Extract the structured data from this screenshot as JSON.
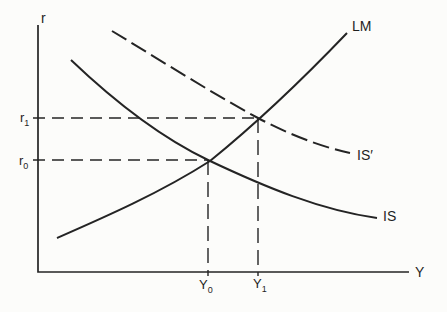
{
  "figure": {
    "bg_color": "#fcfcfa",
    "ink_color": "#242424",
    "width": 447,
    "height": 312,
    "axes": {
      "y_axis_label": "r",
      "x_axis_label": "Y",
      "origin_x": 38,
      "origin_y": 272,
      "y_top": 25,
      "x_right": 409,
      "y_label_x": 41,
      "y_label_y": 23,
      "x_label_x": 415,
      "x_label_y": 277,
      "stroke_width": 1.7
    },
    "curves": [
      {
        "id": "lm",
        "label": "LM",
        "dashed": false,
        "path": "M57,238 C105,217 160,193 210,161 C252,127 303,79 347,33",
        "label_x": 352,
        "label_y": 31,
        "stroke_width": 2
      },
      {
        "id": "is",
        "label": "IS",
        "dashed": false,
        "path": "M71,60 C115,102 160,137 208,160 C265,187 320,210 377,218",
        "label_x": 383,
        "label_y": 221,
        "stroke_width": 2
      },
      {
        "id": "is-prime",
        "label": "IS′",
        "dashed": true,
        "dash_pattern": "17 6",
        "path": "M112,31 C160,60 210,92 258,118 C290,135 322,147 350,153",
        "label_x": 357,
        "label_y": 160,
        "stroke_width": 2
      }
    ],
    "guides": [
      {
        "id": "r1-guide",
        "x1": 33,
        "y1": 118,
        "x2": 258,
        "y2": 118,
        "dash": "12 7",
        "stroke_width": 1.4
      },
      {
        "id": "r0-guide",
        "x1": 33,
        "y1": 160,
        "x2": 208,
        "y2": 160,
        "dash": "12 7",
        "stroke_width": 1.4
      },
      {
        "id": "y0-guide",
        "x1": 208,
        "y1": 160,
        "x2": 208,
        "y2": 276,
        "dash": "15 7",
        "stroke_width": 1.4
      },
      {
        "id": "y1-guide",
        "x1": 258,
        "y1": 118,
        "x2": 258,
        "y2": 276,
        "dash": "15 7",
        "stroke_width": 1.4
      }
    ],
    "point_labels": [
      {
        "id": "r1",
        "base": "r",
        "sub": "1",
        "x": 20,
        "y": 122
      },
      {
        "id": "r0",
        "base": "r",
        "sub": "0",
        "x": 19,
        "y": 165
      },
      {
        "id": "y0",
        "base": "Y",
        "sub": "0",
        "x": 199,
        "y": 289
      },
      {
        "id": "y1",
        "base": "Y",
        "sub": "1",
        "x": 253,
        "y": 288
      }
    ],
    "font": {
      "curve_label_size": 14,
      "axis_label_size": 14,
      "point_label_size": 13,
      "subscript_size": 9,
      "subscript_dy": 4
    }
  }
}
